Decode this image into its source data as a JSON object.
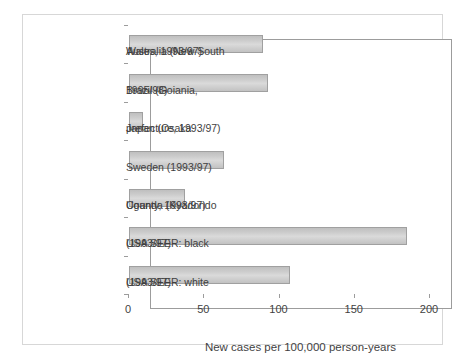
{
  "chart_data": {
    "type": "bar",
    "orientation": "horizontal",
    "title": "",
    "xlabel": "New cases per 100,000 person-years",
    "ylabel": "",
    "xlim": [
      0,
      200
    ],
    "xticks": [
      0,
      50,
      100,
      150,
      200
    ],
    "grid": false,
    "legend": false,
    "categories": [
      "Australia (New South Wales, 1993/97)",
      "Brazil (Goiania, 1995/98)",
      "Japan (Osaka prefecture, 1993/97)",
      "Sweden (1993/97)",
      "Uganda (Kyadondo County, 1993/97)",
      "USA SEER: black (1993/97)",
      "USA SEER: white (1993/97)"
    ],
    "category_lines": [
      [
        "Australia (New South",
        "Wales, 1993/97)"
      ],
      [
        "Brazil (Goiania,",
        "1995/98)"
      ],
      [
        "Japan (Osaka",
        "prefecture, 1993/97)"
      ],
      [
        "Sweden (1993/97)"
      ],
      [
        "Uganda (Kyadondo",
        "County, 1993/97)"
      ],
      [
        "USA SEER: black",
        "(1993/97)"
      ],
      [
        "USA SEER: white",
        "(1993/97)"
      ]
    ],
    "values": [
      89,
      92,
      9,
      63,
      37,
      185,
      107
    ],
    "colors": {
      "bar_gradient": [
        "#bfbfbf",
        "#cdcdcd",
        "#dadada",
        "#cdcdcd",
        "#c2c2c2"
      ],
      "bar_border": "#a0a0a0",
      "plot_border": "#9c9c9c",
      "axis": "#9c9c9c",
      "frame": "#d7d7d7",
      "text": "#3f3f3f",
      "background": "#ffffff"
    }
  }
}
